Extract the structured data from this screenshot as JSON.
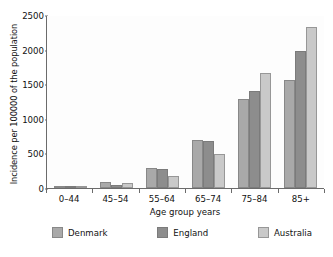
{
  "chart_data": {
    "type": "bar",
    "title": "",
    "xlabel": "Age group years",
    "ylabel": "Incidence per 100000 of the population",
    "categories": [
      "0–44",
      "45–54",
      "55–64",
      "65–74",
      "75–84",
      "85+"
    ],
    "series": [
      {
        "name": "Denmark",
        "color": "#a9a9a9",
        "values": [
          10,
          90,
          290,
          690,
          1290,
          1565
        ]
      },
      {
        "name": "England",
        "color": "#8d8d8d",
        "values": [
          8,
          50,
          275,
          675,
          1405,
          1980
        ]
      },
      {
        "name": "Australia",
        "color": "#c9c9c9",
        "values": [
          10,
          75,
          180,
          490,
          1655,
          2330
        ]
      }
    ],
    "ylim": [
      0,
      2500
    ],
    "yticks": [
      0,
      500,
      1000,
      1500,
      2000,
      2500
    ],
    "ytick_labels": [
      "0",
      "500",
      "1000",
      "1500",
      "2000",
      "2500"
    ],
    "grid": false,
    "legend_position": "bottom"
  }
}
